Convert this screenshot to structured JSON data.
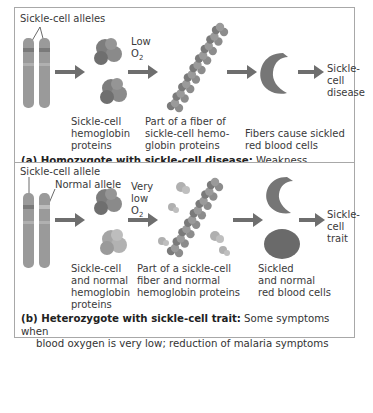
{
  "panel_a": {
    "alleles_label": "Sickle-cell alleles",
    "low_o2_line1": "Low",
    "low_o2_line2": "O",
    "low_o2_sub": "2",
    "proteins_label": [
      "Sickle-cell",
      "hemoglobin",
      "proteins"
    ],
    "fiber_label": [
      "Part of a fiber of",
      "sickle-cell hemo-",
      "globin proteins"
    ],
    "cells_label": [
      "Fibers cause sickled",
      "red blood cells"
    ],
    "outcome_label": [
      "Sickle-",
      "cell",
      "disease"
    ],
    "caption_bold": "(a) Homozygote with sickle-cell disease:",
    "caption_rest": " Weakness, anemia,",
    "caption_line2": "pain and fever, organ damage"
  },
  "panel_b": {
    "sickle_allele_label": "Sickle-cell allele",
    "normal_allele_label": "Normal allele",
    "very_low_o2_line1": "Very",
    "very_low_o2_line2": "low",
    "very_low_o2_line3": "O",
    "very_low_o2_sub": "2",
    "proteins_label": [
      "Sickle-cell",
      "and normal",
      "hemoglobin",
      "proteins"
    ],
    "fiber_label": [
      "Part of a sickle-cell",
      "fiber and normal",
      "hemoglobin proteins"
    ],
    "cells_label": [
      "Sickled",
      "and normal",
      "red blood cells"
    ],
    "outcome_label": [
      "Sickle-",
      "cell",
      "trait"
    ],
    "caption_bold": "(b) Heterozygote with sickle-cell trait:",
    "caption_rest": " Some symptoms when",
    "caption_line2": "blood oxygen is very low; reduction of malaria symptoms"
  },
  "colors": {
    "chromosome": "#9a9a9a",
    "protein": "#7d7d7d",
    "arrow": "#6e6e6e",
    "sickle_cell": "#767676",
    "normal_cell": "#6a6a6a",
    "border": "#a8a8a8"
  }
}
